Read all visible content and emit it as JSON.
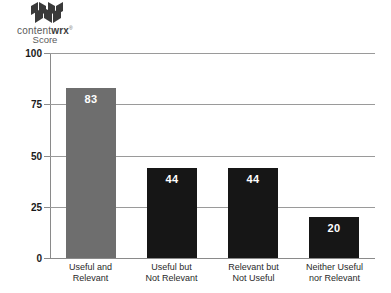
{
  "brand": {
    "logo_icon": "contentwrx-folded-pages-logo",
    "name_light": "content",
    "name_bold": "wrx",
    "trademark": "®",
    "subtitle": "Score"
  },
  "chart_data": {
    "type": "bar",
    "title": "",
    "subtitle": "",
    "xlabel": "",
    "ylabel": "Score",
    "ylim": [
      0,
      100
    ],
    "yticks": [
      0,
      25,
      50,
      75,
      100
    ],
    "ytick_labels": [
      "0",
      "25",
      "50",
      "75",
      "100"
    ],
    "grid": true,
    "grid_axis": "y",
    "legend": false,
    "legend_position": "none",
    "categories": [
      "Useful and Relevant",
      "Useful but Not Relevant",
      "Relevant but Not Useful",
      "Neither Useful nor Relevant"
    ],
    "category_lines": [
      [
        "Useful and",
        "Relevant"
      ],
      [
        "Useful but",
        "Not Relevant"
      ],
      [
        "Relevant but",
        "Not Useful"
      ],
      [
        "Neither Useful",
        "nor Relevant"
      ]
    ],
    "values": [
      83,
      44,
      44,
      20
    ],
    "value_labels": [
      "83",
      "44",
      "44",
      "20"
    ],
    "bar_colors": [
      "#6e6e6e",
      "#161616",
      "#161616",
      "#161616"
    ],
    "value_label_color": "#ffffff"
  },
  "colors": {
    "gray_bar": "#6e6e6e",
    "black_bar": "#161616",
    "gridline": "#9a9a9a",
    "axis": "#8a8a8a",
    "axis_text": "#1a1a1a",
    "category_text": "#2a2a2a",
    "background": "#ffffff"
  }
}
